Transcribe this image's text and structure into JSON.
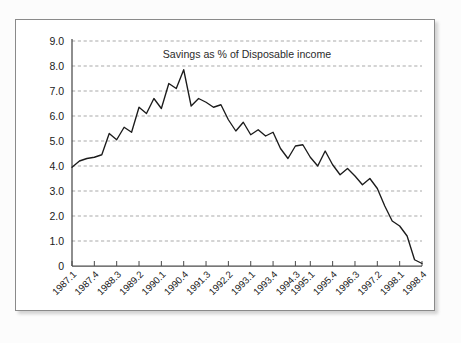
{
  "figure": {
    "background_color": "#fcfcfc",
    "card_background": "#ffffff",
    "border_color": "#8a8a8a"
  },
  "chart_data": {
    "type": "line",
    "title": "Savings as % of Disposable income",
    "xlabel": "",
    "ylabel": "",
    "ylim": [
      0,
      9
    ],
    "grid": true,
    "legend": "none",
    "line_color": "#1b1b1b",
    "ytick_labels": [
      "9.0",
      "8.0",
      "7.0",
      "6.0",
      "5.0",
      "4.0",
      "3.0",
      "2.0",
      "1.0",
      "0"
    ],
    "ytick_values": [
      9.0,
      8.0,
      7.0,
      6.0,
      5.0,
      4.0,
      3.0,
      2.0,
      1.0,
      0
    ],
    "xtick_labels": [
      "1987.1",
      "1987.4",
      "1988.3",
      "1989.2",
      "1990.1",
      "1990.4",
      "1991.3",
      "1992.2",
      "1993.1",
      "1993.4",
      "1994.3",
      "1995.1",
      "1995.4",
      "1996.3",
      "1997.2",
      "1998.1",
      "1998.4"
    ],
    "xtick_indices": [
      0,
      3,
      6,
      9,
      12,
      15,
      18,
      21,
      24,
      27,
      30,
      32,
      35,
      38,
      41,
      44,
      47
    ],
    "categories": [
      "1987.1",
      "1987.2",
      "1987.3",
      "1987.4",
      "1988.1",
      "1988.2",
      "1988.3",
      "1988.4",
      "1989.1",
      "1989.2",
      "1989.3",
      "1989.4",
      "1990.1",
      "1990.2",
      "1990.3",
      "1990.4",
      "1991.1",
      "1991.2",
      "1991.3",
      "1991.4",
      "1992.1",
      "1992.2",
      "1992.3",
      "1992.4",
      "1993.1",
      "1993.2",
      "1993.3",
      "1993.4",
      "1994.1",
      "1994.2",
      "1994.3",
      "1994.4",
      "1995.1",
      "1995.2",
      "1995.3",
      "1995.4",
      "1996.1",
      "1996.2",
      "1996.3",
      "1996.4",
      "1997.1",
      "1997.2",
      "1997.3",
      "1997.4",
      "1998.1",
      "1998.2",
      "1998.3",
      "1998.4"
    ],
    "values": [
      3.95,
      4.2,
      4.3,
      4.35,
      4.45,
      5.3,
      5.05,
      5.55,
      5.35,
      6.35,
      6.1,
      6.7,
      6.3,
      7.3,
      7.1,
      7.85,
      6.4,
      6.7,
      6.55,
      6.35,
      6.45,
      5.85,
      5.4,
      5.75,
      5.25,
      5.45,
      5.2,
      5.35,
      4.7,
      4.3,
      4.8,
      4.85,
      4.35,
      4.0,
      4.6,
      4.05,
      3.65,
      3.9,
      3.6,
      3.25,
      3.5,
      3.1,
      2.4,
      1.8,
      1.6,
      1.2,
      0.25,
      0.1
    ],
    "series": [
      {
        "name": "Savings as % of Disposable income",
        "values": [
          3.95,
          4.2,
          4.3,
          4.35,
          4.45,
          5.3,
          5.05,
          5.55,
          5.35,
          6.35,
          6.1,
          6.7,
          6.3,
          7.3,
          7.1,
          7.85,
          6.4,
          6.7,
          6.55,
          6.35,
          6.45,
          5.85,
          5.4,
          5.75,
          5.25,
          5.45,
          5.2,
          5.35,
          4.7,
          4.3,
          4.8,
          4.85,
          4.35,
          4.0,
          4.6,
          4.05,
          3.65,
          3.9,
          3.6,
          3.25,
          3.5,
          3.1,
          2.4,
          1.8,
          1.6,
          1.2,
          0.25,
          0.1
        ]
      }
    ]
  }
}
